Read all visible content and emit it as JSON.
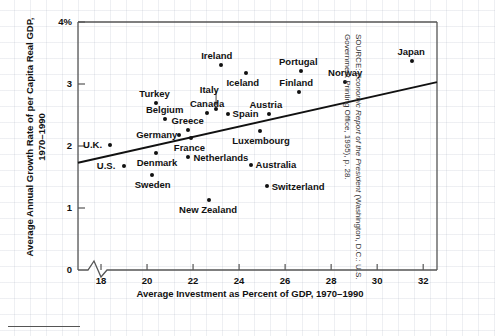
{
  "chart_data": {
    "type": "scatter",
    "title": "",
    "xlabel": "Average Investment as Percent of GDP, 1970–1990",
    "ylabel": "Average Annual Growth Rate of per Capita Real GDP, 1970–1990",
    "xlim": [
      17.0,
      32.6
    ],
    "ylim": [
      0,
      4
    ],
    "xticks": [
      18,
      20,
      22,
      24,
      26,
      28,
      30,
      32
    ],
    "xticklabels": [
      "18",
      "20",
      "22",
      "24",
      "26",
      "28",
      "30",
      "32"
    ],
    "yticks": [
      0,
      1,
      2,
      3,
      4
    ],
    "yticklabels": [
      "0",
      "1",
      "2",
      "3",
      "4%"
    ],
    "axis_break": true,
    "grid": true,
    "legend": null,
    "points": [
      {
        "label": "U.K.",
        "x": 18.4,
        "y": 2.02,
        "label_pos": "left"
      },
      {
        "label": "U.S.",
        "x": 19.0,
        "y": 1.68,
        "label_pos": "left"
      },
      {
        "label": "Sweden",
        "x": 20.2,
        "y": 1.54,
        "label_pos": "below"
      },
      {
        "label": "Denmark",
        "x": 20.4,
        "y": 1.88,
        "label_pos": "below"
      },
      {
        "label": "Turkey",
        "x": 20.4,
        "y": 2.7,
        "label_pos": "above"
      },
      {
        "label": "Belgium",
        "x": 20.8,
        "y": 2.43,
        "label_pos": "above"
      },
      {
        "label": "Germany",
        "x": 21.4,
        "y": 2.18,
        "label_pos": "left"
      },
      {
        "label": "Netherlands",
        "x": 21.8,
        "y": 1.82,
        "label_pos": "right"
      },
      {
        "label": "Greece",
        "x": 21.8,
        "y": 2.26,
        "label_pos": "above"
      },
      {
        "label": "France",
        "x": 21.9,
        "y": 2.13,
        "label_pos": "below"
      },
      {
        "label": "Canada",
        "x": 22.6,
        "y": 2.54,
        "label_pos": "above"
      },
      {
        "label": "New Zealand",
        "x": 22.7,
        "y": 1.13,
        "label_pos": "below"
      },
      {
        "label": "Italy",
        "x": 23.0,
        "y": 2.6,
        "label_pos": "leader"
      },
      {
        "label": "Ireland",
        "x": 23.2,
        "y": 3.3,
        "label_pos": "above"
      },
      {
        "label": "Spain",
        "x": 23.5,
        "y": 2.52,
        "label_pos": "right"
      },
      {
        "label": "Iceland",
        "x": 24.3,
        "y": 3.18,
        "label_pos": "below"
      },
      {
        "label": "Australia",
        "x": 24.5,
        "y": 1.7,
        "label_pos": "right"
      },
      {
        "label": "Austria",
        "x": 25.3,
        "y": 2.51,
        "label_pos": "above"
      },
      {
        "label": "Luxembourg",
        "x": 24.9,
        "y": 2.25,
        "label_pos": "below"
      },
      {
        "label": "Switzerland",
        "x": 25.2,
        "y": 1.35,
        "label_pos": "right"
      },
      {
        "label": "Finland",
        "x": 26.6,
        "y": 2.87,
        "label_pos": "above"
      },
      {
        "label": "Portugal",
        "x": 26.7,
        "y": 3.21,
        "label_pos": "above"
      },
      {
        "label": "Norway",
        "x": 28.6,
        "y": 3.04,
        "label_pos": "above"
      },
      {
        "label": "Japan",
        "x": 31.5,
        "y": 3.37,
        "label_pos": "above"
      }
    ],
    "trend_line": {
      "x_start": 17.0,
      "y_start": 1.73,
      "x_end": 32.6,
      "y_end": 3.03
    }
  },
  "source": {
    "prefix": "SOURCE: ",
    "italic_title": "Economic Report of the President",
    "suffix": " (Washington, D.C.: U.S. Government Printing Office, 1995), p. 28."
  }
}
